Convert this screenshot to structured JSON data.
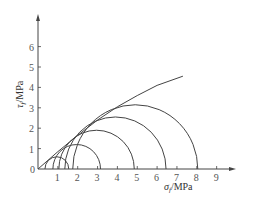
{
  "chart_data": {
    "type": "line",
    "title": "",
    "xlabel": "σ_f /MPa",
    "ylabel": "τ_f /MPa",
    "x_ticks": [
      1,
      2,
      3,
      4,
      5,
      6,
      7,
      8,
      9
    ],
    "y_ticks": [
      1,
      2,
      3,
      4,
      5,
      6
    ],
    "origin_label": "0",
    "xlim": [
      0,
      9.8
    ],
    "ylim": [
      0,
      7
    ],
    "grid": false,
    "mohr_circles": [
      {
        "center": 0.95,
        "radius": 0.6
      },
      {
        "center": 1.95,
        "radius": 1.2
      },
      {
        "center": 2.95,
        "radius": 1.9
      },
      {
        "center": 3.9,
        "radius": 2.55
      },
      {
        "center": 4.9,
        "radius": 3.15
      }
    ],
    "series": [
      {
        "name": "strength envelope",
        "x": [
          0,
          1,
          2,
          3,
          4,
          5,
          6,
          7.3
        ],
        "y": [
          0,
          0.85,
          1.65,
          2.4,
          3.05,
          3.6,
          4.1,
          4.55
        ]
      }
    ]
  },
  "labels": {
    "xlabel_main": "σ",
    "xlabel_sub": "f",
    "xlabel_unit": "/MPa",
    "ylabel_main": "τ",
    "ylabel_sub": "f",
    "ylabel_unit": "/MPa",
    "origin": "0",
    "x_tick_1": "1",
    "x_tick_2": "2",
    "x_tick_3": "3",
    "x_tick_4": "4",
    "x_tick_5": "5",
    "x_tick_6": "6",
    "x_tick_7": "7",
    "x_tick_8": "8",
    "x_tick_9": "9",
    "y_tick_1": "1",
    "y_tick_2": "2",
    "y_tick_3": "3",
    "y_tick_4": "4",
    "y_tick_5": "5",
    "y_tick_6": "6"
  }
}
